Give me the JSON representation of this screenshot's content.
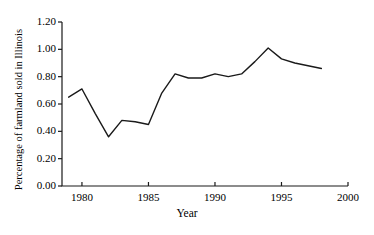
{
  "chart_data": {
    "type": "line",
    "title": "",
    "xlabel": "Year",
    "ylabel": "Percentage of farmland sold in Illinois",
    "xlim": [
      1978.5,
      2000
    ],
    "ylim": [
      0.0,
      1.2
    ],
    "grid": false,
    "legend": null,
    "x_ticks": [
      1980,
      1985,
      1990,
      1995,
      2000
    ],
    "x_tick_labels": [
      "1980",
      "1985",
      "1990",
      "1995",
      "2000"
    ],
    "y_ticks": [
      0.0,
      0.2,
      0.4,
      0.6,
      0.8,
      1.0,
      1.2
    ],
    "y_tick_labels": [
      "0.00",
      "0.20",
      "0.40",
      "0.60",
      "0.80",
      "1.00",
      "1.20"
    ],
    "line_color": "#1a1a1a",
    "line_width": 1.4,
    "series": [
      {
        "name": "Percentage of farmland sold in Illinois",
        "x": [
          1979.0,
          1980.0,
          1981.0,
          1982.0,
          1983.0,
          1984.0,
          1985.0,
          1986.0,
          1987.0,
          1988.0,
          1989.0,
          1990.0,
          1991.0,
          1992.0,
          1993.0,
          1994.0,
          1995.0,
          1996.0,
          1997.0,
          1998.0
        ],
        "values": [
          0.65,
          0.71,
          0.53,
          0.36,
          0.48,
          0.47,
          0.45,
          0.68,
          0.82,
          0.79,
          0.79,
          0.82,
          0.8,
          0.82,
          0.91,
          1.01,
          0.93,
          0.9,
          0.88,
          0.86
        ]
      }
    ]
  },
  "axes": {
    "x_axis_label": "Year",
    "y_axis_label": "Percentage of farmland sold in Illinois"
  }
}
